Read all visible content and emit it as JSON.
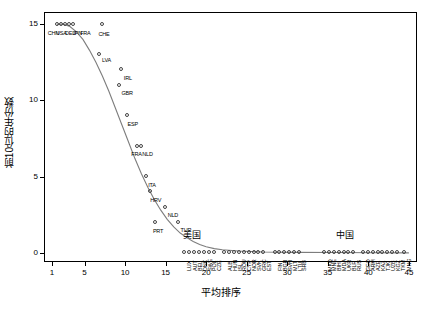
{
  "chart": {
    "type": "scatter",
    "title": "",
    "xlabel": "平均排序",
    "ylabel": "前10位的年份数",
    "xlim": [
      0,
      46
    ],
    "ylim": [
      -0.6,
      15.8
    ],
    "xticks": [
      1,
      5,
      10,
      15,
      20,
      25,
      30,
      35,
      40,
      45
    ],
    "yticks": [
      0,
      5,
      10,
      15
    ],
    "grid": false,
    "legend": "none",
    "annotations": [
      {
        "text": "美国",
        "x": 17.2,
        "y": 0.95
      },
      {
        "text": "中国",
        "x": 36.0,
        "y": 0.95
      }
    ],
    "fit_curve": {
      "color": "#7d7d7d",
      "points": [
        [
          1.6,
          15.0
        ],
        [
          2.4,
          15.0
        ],
        [
          3.2,
          14.85
        ],
        [
          4.0,
          14.5
        ],
        [
          4.8,
          14.0
        ],
        [
          5.6,
          13.3
        ],
        [
          6.4,
          12.5
        ],
        [
          7.2,
          11.6
        ],
        [
          8.0,
          10.6
        ],
        [
          8.8,
          9.5
        ],
        [
          9.6,
          8.4
        ],
        [
          10.4,
          7.3
        ],
        [
          11.2,
          6.2
        ],
        [
          12.0,
          5.2
        ],
        [
          12.8,
          4.3
        ],
        [
          13.6,
          3.5
        ],
        [
          14.4,
          2.8
        ],
        [
          15.2,
          2.2
        ],
        [
          16.0,
          1.7
        ],
        [
          16.8,
          1.3
        ],
        [
          17.6,
          1.0
        ],
        [
          18.4,
          0.75
        ],
        [
          19.2,
          0.55
        ],
        [
          20.0,
          0.4
        ],
        [
          21.0,
          0.28
        ],
        [
          22.0,
          0.2
        ],
        [
          24.0,
          0.12
        ],
        [
          27.0,
          0.06
        ],
        [
          31.0,
          0.03
        ],
        [
          36.0,
          0.02
        ],
        [
          41.0,
          0.01
        ],
        [
          45.0,
          0.0
        ]
      ]
    },
    "points": [
      {
        "x": 1.7,
        "y": 15.0,
        "label": "CHN",
        "lx": -10,
        "ly": 6
      },
      {
        "x": 2.1,
        "y": 15.0,
        "label": "USA",
        "lx": -5,
        "ly": 6
      },
      {
        "x": 2.6,
        "y": 15.0,
        "label": "DEU",
        "lx": 0,
        "ly": 6
      },
      {
        "x": 3.1,
        "y": 15.0,
        "label": "JPN",
        "lx": 3,
        "ly": 6
      },
      {
        "x": 3.6,
        "y": 15.0,
        "label": "FRA",
        "lx": 7,
        "ly": 6
      },
      {
        "x": 7.2,
        "y": 15.0,
        "label": "CHE",
        "lx": -4,
        "ly": 7
      },
      {
        "x": 6.9,
        "y": 13.0,
        "label": "LVA",
        "lx": 2,
        "ly": 2
      },
      {
        "x": 9.6,
        "y": 12.0,
        "label": "IRL",
        "lx": 2,
        "ly": 5
      },
      {
        "x": 9.3,
        "y": 11.0,
        "label": "GBR",
        "lx": 2,
        "ly": 5
      },
      {
        "x": 10.3,
        "y": 9.0,
        "label": "ESP",
        "lx": 0,
        "ly": 5
      },
      {
        "x": 11.5,
        "y": 7.0,
        "label": "FRA",
        "lx": -6,
        "ly": 5
      },
      {
        "x": 12.0,
        "y": 7.0,
        "label": "NLD",
        "lx": 1,
        "ly": 5
      },
      {
        "x": 12.6,
        "y": 5.0,
        "label": "ITA",
        "lx": 2,
        "ly": 5
      },
      {
        "x": 13.1,
        "y": 4.0,
        "label": "HRV",
        "lx": 0,
        "ly": 5
      },
      {
        "x": 15.0,
        "y": 3.0,
        "label": "NLD",
        "lx": 2,
        "ly": 5
      },
      {
        "x": 13.8,
        "y": 2.0,
        "label": "PRT",
        "lx": -3,
        "ly": 6
      },
      {
        "x": 16.6,
        "y": 2.0,
        "label": "TUR",
        "lx": 2,
        "ly": 5
      },
      {
        "x": 17.3,
        "y": 0.0,
        "label": "LUX",
        "lx": -3,
        "ly": 4
      },
      {
        "x": 18.0,
        "y": 0.0,
        "label": "AUT",
        "lx": -3,
        "ly": 4
      },
      {
        "x": 18.6,
        "y": 0.0,
        "label": "BEL",
        "lx": -3,
        "ly": 4
      },
      {
        "x": 19.2,
        "y": 0.0,
        "label": "DNK",
        "lx": -3,
        "ly": 4
      },
      {
        "x": 19.8,
        "y": 0.0,
        "label": "SWE",
        "lx": -3,
        "ly": 4
      },
      {
        "x": 20.4,
        "y": 0.0,
        "label": "POL",
        "lx": -3,
        "ly": 4
      },
      {
        "x": 21.0,
        "y": 0.0,
        "label": "CZE",
        "lx": -3,
        "ly": 4
      },
      {
        "x": 22.3,
        "y": 0.0,
        "label": "ALB",
        "lx": -3,
        "ly": 4
      },
      {
        "x": 22.9,
        "y": 0.0,
        "label": "HUN",
        "lx": -3,
        "ly": 4
      },
      {
        "x": 23.5,
        "y": 0.0,
        "label": "ISL",
        "lx": -3,
        "ly": 4
      },
      {
        "x": 24.1,
        "y": 0.0,
        "label": "ROU",
        "lx": -3,
        "ly": 4
      },
      {
        "x": 24.7,
        "y": 0.0,
        "label": "CYP",
        "lx": -3,
        "ly": 4
      },
      {
        "x": 25.3,
        "y": 0.0,
        "label": "NOR",
        "lx": -3,
        "ly": 4
      },
      {
        "x": 25.9,
        "y": 0.0,
        "label": "SVK",
        "lx": -3,
        "ly": 4
      },
      {
        "x": 26.5,
        "y": 0.0,
        "label": "GRC",
        "lx": -3,
        "ly": 4
      },
      {
        "x": 27.1,
        "y": 0.0,
        "label": "EST",
        "lx": -3,
        "ly": 4
      },
      {
        "x": 28.5,
        "y": 0.0,
        "label": "FIN",
        "lx": -3,
        "ly": 4
      },
      {
        "x": 29.1,
        "y": 0.0,
        "label": "BGR",
        "lx": -3,
        "ly": 4
      },
      {
        "x": 29.7,
        "y": 0.0,
        "label": "SVN",
        "lx": -3,
        "ly": 4
      },
      {
        "x": 30.3,
        "y": 0.0,
        "label": "MLT",
        "lx": -3,
        "ly": 4
      },
      {
        "x": 30.9,
        "y": 0.0,
        "label": "LTU",
        "lx": -3,
        "ly": 4
      },
      {
        "x": 31.5,
        "y": 0.0,
        "label": "SRB",
        "lx": -3,
        "ly": 4
      },
      {
        "x": 34.6,
        "y": 0.0,
        "label": "MKD",
        "lx": -3,
        "ly": 4
      },
      {
        "x": 35.2,
        "y": 0.0,
        "label": "MNE",
        "lx": -3,
        "ly": 4
      },
      {
        "x": 35.8,
        "y": 0.0,
        "label": "BIH",
        "lx": -3,
        "ly": 4
      },
      {
        "x": 36.4,
        "y": 0.0,
        "label": "MDA",
        "lx": -3,
        "ly": 4
      },
      {
        "x": 37.0,
        "y": 0.0,
        "label": "UKR",
        "lx": -3,
        "ly": 4
      },
      {
        "x": 37.6,
        "y": 0.0,
        "label": "BLR",
        "lx": -3,
        "ly": 4
      },
      {
        "x": 38.2,
        "y": 0.0,
        "label": "RUS",
        "lx": -3,
        "ly": 4
      },
      {
        "x": 39.4,
        "y": 0.0,
        "label": "GEO",
        "lx": -3,
        "ly": 4
      },
      {
        "x": 40.0,
        "y": 0.0,
        "label": "ARM",
        "lx": -3,
        "ly": 4
      },
      {
        "x": 40.6,
        "y": 0.0,
        "label": "AZE",
        "lx": -3,
        "ly": 4
      },
      {
        "x": 41.2,
        "y": 0.0,
        "label": "KAZ",
        "lx": -3,
        "ly": 4
      },
      {
        "x": 41.8,
        "y": 0.0,
        "label": "TJK",
        "lx": -3,
        "ly": 4
      },
      {
        "x": 42.4,
        "y": 0.0,
        "label": "UZB",
        "lx": -3,
        "ly": 4
      },
      {
        "x": 43.0,
        "y": 0.0,
        "label": "KGZ",
        "lx": -3,
        "ly": 4
      },
      {
        "x": 43.6,
        "y": 0.0,
        "label": "TKM",
        "lx": -3,
        "ly": 4
      },
      {
        "x": 44.4,
        "y": 0.0,
        "label": "MNG",
        "lx": -3,
        "ly": 4
      }
    ]
  }
}
